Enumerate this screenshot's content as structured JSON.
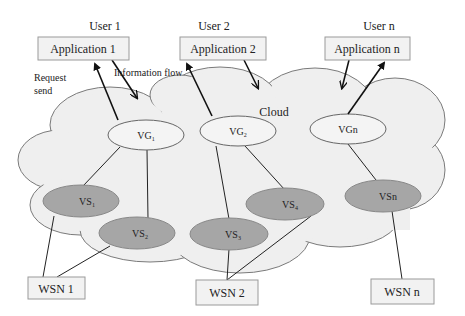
{
  "users": [
    {
      "label": "User 1",
      "app": "Application 1"
    },
    {
      "label": "User 2",
      "app": "Application 2"
    },
    {
      "label": "User n",
      "app": "Application n"
    }
  ],
  "annotations": {
    "request": "Request",
    "send": "send",
    "information_flow": "Information flow",
    "cloud": "Cloud"
  },
  "virtual_groups": [
    {
      "base": "VG",
      "sub": "1"
    },
    {
      "base": "VG",
      "sub": "2"
    },
    {
      "base": "VGn",
      "sub": ""
    }
  ],
  "virtual_sensors": [
    {
      "base": "VS",
      "sub": "1"
    },
    {
      "base": "VS",
      "sub": "2"
    },
    {
      "base": "VS",
      "sub": "3"
    },
    {
      "base": "VS",
      "sub": "4"
    },
    {
      "base": "VSn",
      "sub": ""
    }
  ],
  "wsn": [
    {
      "label": "WSN 1"
    },
    {
      "label": "WSN 2"
    },
    {
      "label": "WSN n"
    }
  ],
  "colors": {
    "cloud_fill": "#efefef",
    "cloud_stroke": "#7a7a7a",
    "box_fill": "#f2f2f2",
    "box_stroke": "#9a9a9a",
    "vs_fill": "#a6a6a6",
    "vg_fill": "#f4f4f4"
  }
}
